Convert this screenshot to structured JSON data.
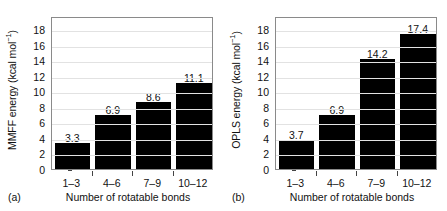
{
  "figure": {
    "background": "#ffffff",
    "bar_color": "#000000",
    "frame_color": "#8a8a8a",
    "grid_color": "#e2e2e2"
  },
  "panels": [
    {
      "tag": "(a)",
      "tag_name": "panel-label-a",
      "ylabel_main": "MMFF energy (kcal mol",
      "ylabel_sup": "−1",
      "ylabel_close": ")",
      "ylabel_full": "MMFF energy (kcal mol⁻¹)",
      "xlabel": "Number of rotatable bonds",
      "yticks": [
        "0",
        "2",
        "4",
        "6",
        "8",
        "10",
        "12",
        "14",
        "16",
        "18"
      ],
      "chart_data": {
        "type": "bar",
        "title": "",
        "xlabel": "Number of rotatable bonds",
        "ylabel": "MMFF energy (kcal mol⁻¹)",
        "categories": [
          "1–3",
          "4–6",
          "7–9",
          "10–12"
        ],
        "values": [
          3.3,
          6.9,
          8.6,
          11.1
        ],
        "value_labels": [
          "3.3",
          "6.9",
          "8.6",
          "11.1"
        ],
        "ylim": [
          0,
          19.7
        ],
        "ytick_values": [
          0,
          2,
          4,
          6,
          8,
          10,
          12,
          14,
          16,
          18
        ],
        "grid": true,
        "legend": "none"
      }
    },
    {
      "tag": "(b)",
      "tag_name": "panel-label-b",
      "ylabel_main": "OPLS energy (kcal mol",
      "ylabel_sup": "−1",
      "ylabel_close": ")",
      "ylabel_full": "OPLS energy (kcal mol⁻¹)",
      "xlabel": "Number of rotatable bonds",
      "yticks": [
        "0",
        "2",
        "4",
        "6",
        "8",
        "10",
        "12",
        "14",
        "16",
        "18"
      ],
      "chart_data": {
        "type": "bar",
        "title": "",
        "xlabel": "Number of rotatable bonds",
        "ylabel": "OPLS energy (kcal mol⁻¹)",
        "categories": [
          "1–3",
          "4–6",
          "7–9",
          "10–12"
        ],
        "values": [
          3.7,
          6.9,
          14.2,
          17.4
        ],
        "value_labels": [
          "3.7",
          "6.9",
          "14.2",
          "17.4"
        ],
        "ylim": [
          0,
          19.7
        ],
        "ytick_values": [
          0,
          2,
          4,
          6,
          8,
          10,
          12,
          14,
          16,
          18
        ],
        "grid": true,
        "legend": "none"
      }
    }
  ],
  "chart_data": [
    {
      "type": "bar",
      "title": "",
      "panel": "(a)",
      "xlabel": "Number of rotatable bonds",
      "ylabel": "MMFF energy (kcal mol⁻¹)",
      "categories": [
        "1–3",
        "4–6",
        "7–9",
        "10–12"
      ],
      "values": [
        3.3,
        6.9,
        8.6,
        11.1
      ],
      "ylim": [
        0,
        19.7
      ],
      "grid": true,
      "legend": "none"
    },
    {
      "type": "bar",
      "title": "",
      "panel": "(b)",
      "xlabel": "Number of rotatable bonds",
      "ylabel": "OPLS energy (kcal mol⁻¹)",
      "categories": [
        "1–3",
        "4–6",
        "7–9",
        "10–12"
      ],
      "values": [
        3.7,
        6.9,
        14.2,
        17.4
      ],
      "ylim": [
        0,
        19.7
      ],
      "grid": true,
      "legend": "none"
    }
  ]
}
